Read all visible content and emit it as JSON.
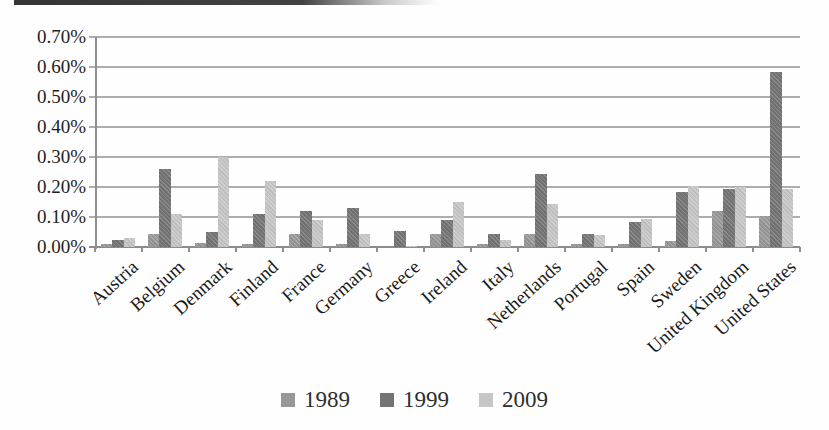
{
  "chart_data": {
    "type": "bar",
    "title": "",
    "xlabel": "",
    "ylabel": "",
    "categories": [
      "Austria",
      "Belgium",
      "Denmark",
      "Finland",
      "France",
      "Germany",
      "Greece",
      "Ireland",
      "Italy",
      "Netherlands",
      "Portugal",
      "Spain",
      "Sweden",
      "United Kingdom",
      "United States"
    ],
    "series": [
      {
        "name": "1989",
        "color": "#989898",
        "values": [
          0.01,
          0.045,
          0.015,
          0.01,
          0.045,
          0.01,
          0,
          0.045,
          0.01,
          0.045,
          0.01,
          0.01,
          0.02,
          0.12,
          0.105
        ]
      },
      {
        "name": "1999",
        "color": "#747474",
        "values": [
          0.025,
          0.26,
          0.05,
          0.11,
          0.12,
          0.13,
          0.055,
          0.09,
          0.045,
          0.245,
          0.045,
          0.085,
          0.185,
          0.195,
          0.585
        ]
      },
      {
        "name": "2009",
        "color": "#c6c6c6",
        "values": [
          0.03,
          0.11,
          0.3,
          0.22,
          0.09,
          0.045,
          0.005,
          0.15,
          0.025,
          0.145,
          0.04,
          0.095,
          0.205,
          0.2,
          0.195
        ]
      }
    ],
    "y_tick_labels": [
      "0.00%",
      "0.10%",
      "0.20%",
      "0.30%",
      "0.40%",
      "0.50%",
      "0.60%",
      "0.70%"
    ],
    "ylim": [
      0,
      0.7
    ],
    "y_tick_step": 0.1,
    "unit": "percent",
    "grid": true,
    "legend_position": "bottom"
  },
  "colors": {
    "gridline": "#adadad",
    "axis": "#8f8f8f",
    "text": "#1f1f1f"
  }
}
